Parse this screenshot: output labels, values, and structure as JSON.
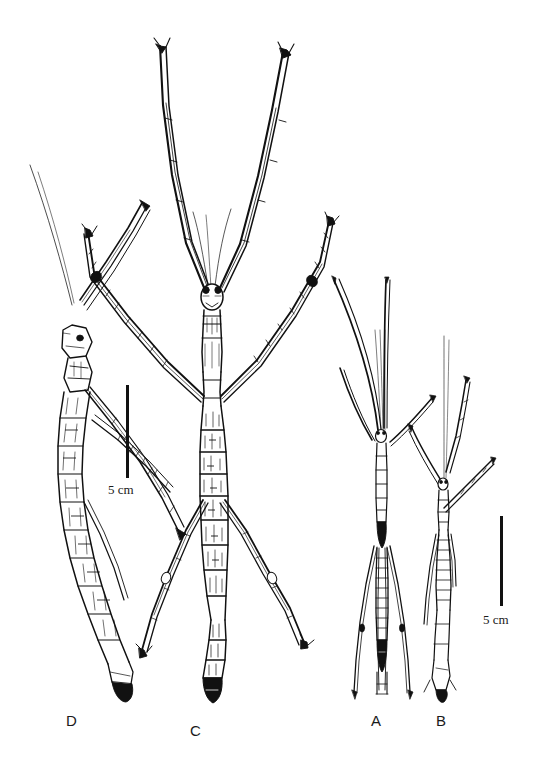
{
  "figure": {
    "kind": "scientific-line-drawing",
    "background_color": "#ffffff",
    "ink_color": "#111111"
  },
  "specimen_labels": [
    {
      "id": "D",
      "text": "D",
      "x": 66,
      "y": 712
    },
    {
      "id": "C",
      "text": "C",
      "x": 190,
      "y": 722
    },
    {
      "id": "A",
      "text": "A",
      "x": 371,
      "y": 712
    },
    {
      "id": "B",
      "text": "B",
      "x": 436,
      "y": 712
    }
  ],
  "scale_bars": [
    {
      "id": "left",
      "label": "5 cm",
      "bar_x": 126,
      "bar_top": 385,
      "bar_height": 93,
      "bar_width": 3,
      "label_x": 108,
      "label_y": 482
    },
    {
      "id": "right",
      "label": "5 cm",
      "bar_x": 500,
      "bar_top": 516,
      "bar_height": 90,
      "bar_width": 3,
      "label_x": 483,
      "label_y": 612
    }
  ],
  "specimens": {
    "A": {
      "label": "A",
      "description": "slender dark stick insect, legs and antennae directed upward and downward, body narrow"
    },
    "B": {
      "label": "B",
      "description": "slender stick insect with one long thin antenna and legs angled to the right"
    },
    "C": {
      "label": "C",
      "description": "large robust stick insect, forelegs extended upward, mid and hind legs spread, segmented textured abdomen"
    },
    "D": {
      "label": "D",
      "description": "stick insect shown in lateral-oblique view with long segmented abdomen angled downward"
    }
  }
}
